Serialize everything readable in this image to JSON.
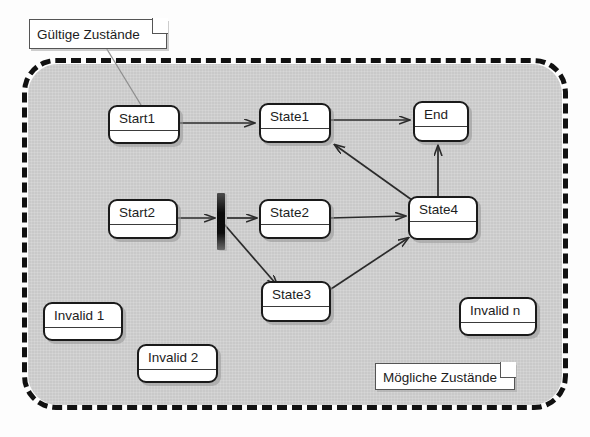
{
  "diagram": {
    "colors": {
      "valid_region_fill": "#c9c9c9",
      "frame_stroke": "#111111",
      "box_fill": "#ffffff",
      "box_stroke": "#1a1a1a",
      "fork_bar": "#0a0a0a",
      "connector": "#2b2b2b",
      "page_background": "#ffffff"
    },
    "notes": [
      {
        "id": "note-valid-states",
        "text": "Gültige Zustände",
        "position": "top-left",
        "fold_corner": "top-right",
        "leader_target": "Start1"
      },
      {
        "id": "note-possible-states",
        "text": "Mögliche Zustände",
        "position": "bottom-right",
        "fold_corner": "top-right",
        "leader_target": "dashed-frame"
      }
    ],
    "states": [
      {
        "id": "start1",
        "label": "Start1",
        "group": "valid"
      },
      {
        "id": "state1",
        "label": "State1",
        "group": "valid"
      },
      {
        "id": "end",
        "label": "End",
        "group": "valid"
      },
      {
        "id": "start2",
        "label": "Start2",
        "group": "valid"
      },
      {
        "id": "state2",
        "label": "State2",
        "group": "valid"
      },
      {
        "id": "state4",
        "label": "State4",
        "group": "valid"
      },
      {
        "id": "state3",
        "label": "State3",
        "group": "valid"
      },
      {
        "id": "invalid1",
        "label": "Invalid 1",
        "group": "invalid"
      },
      {
        "id": "invalid2",
        "label": "Invalid 2",
        "group": "invalid"
      },
      {
        "id": "invalidn",
        "label": "Invalid n",
        "group": "invalid"
      }
    ],
    "fork": {
      "id": "fork-bar",
      "label": "fork-join-bar",
      "orientation": "vertical"
    },
    "transitions": [
      {
        "from": "start1",
        "to": "state1"
      },
      {
        "from": "state1",
        "to": "end"
      },
      {
        "from": "start2",
        "to": "fork"
      },
      {
        "from": "fork",
        "to": "state2"
      },
      {
        "from": "fork",
        "to": "state3"
      },
      {
        "from": "state2",
        "to": "state4"
      },
      {
        "from": "state3",
        "to": "state4"
      },
      {
        "from": "state4",
        "to": "state1"
      },
      {
        "from": "state4",
        "to": "end"
      }
    ]
  }
}
